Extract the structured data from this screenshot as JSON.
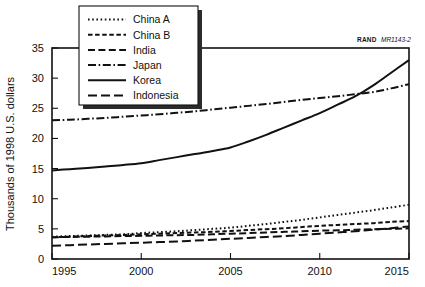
{
  "figure": {
    "credit_prefix": "RAND",
    "credit_id": "MR1143-2"
  },
  "chart_data": {
    "type": "line",
    "title": "",
    "subtitle": "",
    "xlabel": "",
    "ylabel": "Thousands of 1998 U.S. dollars",
    "xlim": [
      1995,
      2015
    ],
    "ylim": [
      0,
      35
    ],
    "grid": false,
    "legend_position": "top-left",
    "xticks": [
      1995,
      2000,
      2005,
      2010,
      2015
    ],
    "xtick_labels": [
      "1995",
      "2000",
      "2005",
      "2010",
      "2015"
    ],
    "yticks": [
      0,
      5,
      10,
      15,
      20,
      25,
      30,
      35
    ],
    "ytick_labels": [
      "0",
      "5",
      "10",
      "15",
      "20",
      "25",
      "30",
      "35"
    ],
    "x": [
      1995,
      1996,
      1997,
      1998,
      1999,
      2000,
      2001,
      2002,
      2003,
      2004,
      2005,
      2006,
      2007,
      2008,
      2009,
      2010,
      2011,
      2012,
      2013,
      2014,
      2015
    ],
    "series": [
      {
        "name": "China A",
        "dash": "dotted",
        "color": "#111111",
        "values": [
          3.7,
          3.8,
          3.9,
          4.0,
          4.1,
          4.3,
          4.45,
          4.6,
          4.8,
          5.0,
          5.2,
          5.5,
          5.8,
          6.15,
          6.5,
          6.9,
          7.3,
          7.7,
          8.1,
          8.55,
          9.0
        ]
      },
      {
        "name": "China B",
        "dash": "short-dash",
        "color": "#111111",
        "values": [
          3.6,
          3.7,
          3.8,
          3.9,
          4.0,
          4.1,
          4.2,
          4.3,
          4.4,
          4.5,
          4.65,
          4.8,
          4.95,
          5.1,
          5.3,
          5.5,
          5.65,
          5.8,
          5.95,
          6.15,
          6.3
        ]
      },
      {
        "name": "India",
        "dash": "medium-dash",
        "color": "#111111",
        "values": [
          3.6,
          3.65,
          3.7,
          3.75,
          3.8,
          3.85,
          3.9,
          3.95,
          4.0,
          4.1,
          4.2,
          4.3,
          4.4,
          4.5,
          4.6,
          4.7,
          4.75,
          4.85,
          4.95,
          5.0,
          5.1
        ]
      },
      {
        "name": "Japan",
        "dash": "dash-dot",
        "color": "#111111",
        "values": [
          23.0,
          23.1,
          23.25,
          23.4,
          23.6,
          23.8,
          24.0,
          24.25,
          24.5,
          24.8,
          25.1,
          25.4,
          25.7,
          26.05,
          26.4,
          26.7,
          27.0,
          27.35,
          27.7,
          28.3,
          29.0
        ]
      },
      {
        "name": "Korea",
        "dash": "solid",
        "color": "#111111",
        "values": [
          14.7,
          14.9,
          15.1,
          15.35,
          15.6,
          15.9,
          16.4,
          16.9,
          17.4,
          17.9,
          18.5,
          19.5,
          20.6,
          21.8,
          23.0,
          24.2,
          25.6,
          27.0,
          28.8,
          30.9,
          33.0
        ]
      },
      {
        "name": "Indonesia",
        "dash": "long-dash",
        "color": "#111111",
        "values": [
          2.2,
          2.3,
          2.4,
          2.5,
          2.6,
          2.7,
          2.8,
          2.9,
          3.05,
          3.2,
          3.35,
          3.5,
          3.65,
          3.8,
          4.0,
          4.2,
          4.4,
          4.6,
          4.85,
          5.1,
          5.4
        ]
      }
    ]
  },
  "legend": {
    "items": [
      {
        "label": "China A"
      },
      {
        "label": "China B"
      },
      {
        "label": "India"
      },
      {
        "label": "Japan"
      },
      {
        "label": "Korea"
      },
      {
        "label": "Indonesia"
      }
    ]
  }
}
